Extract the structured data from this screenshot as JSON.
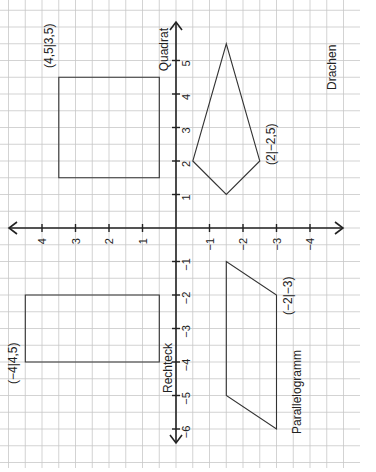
{
  "figure": {
    "orientation": "rotated 90 degrees clockwise",
    "axes": {
      "x_axis_ticks": [
        "5",
        "4",
        "3",
        "2",
        "1",
        "-1",
        "-2",
        "-3",
        "-4",
        "-5",
        "-6"
      ],
      "x_axis_tick_values": [
        5,
        4,
        3,
        2,
        1,
        -1,
        -2,
        -3,
        -4,
        -5,
        -6
      ],
      "y_axis_ticks": [
        "4",
        "3",
        "2",
        "1",
        "-1",
        "-2",
        "-3",
        "-4"
      ],
      "y_axis_tick_values": [
        4,
        3,
        2,
        1,
        -1,
        -2,
        -3,
        -4
      ]
    },
    "shapes": {
      "quadrat": {
        "name": "Quadrat",
        "label": "(4,5|3,5)",
        "vertices": [
          [
            4.5,
            3.5
          ],
          [
            4.5,
            0.5
          ],
          [
            1.5,
            0.5
          ],
          [
            1.5,
            3.5
          ]
        ]
      },
      "drachen": {
        "name": "Drachen",
        "label": "(2|−2,5)",
        "vertices": [
          [
            2,
            -0.5
          ],
          [
            1,
            -1.5
          ],
          [
            2,
            -2.5
          ],
          [
            5.5,
            -1.5
          ]
        ]
      },
      "rechteck": {
        "name": "Rechteck",
        "label": "(−4|4,5)",
        "vertices": [
          [
            -2,
            4.5
          ],
          [
            -2,
            0.5
          ],
          [
            -4,
            0.5
          ],
          [
            -4,
            4.5
          ]
        ]
      },
      "parallelogramm": {
        "name": "Parallelogramm",
        "label": "(−2|−3)",
        "vertices": [
          [
            -1,
            -1.5
          ],
          [
            -5,
            -1.5
          ],
          [
            -6,
            -3
          ],
          [
            -2,
            -3
          ]
        ]
      }
    },
    "colors": {
      "grid": "#c8c8c8",
      "axis": "#222222",
      "shape": "#333333"
    }
  }
}
